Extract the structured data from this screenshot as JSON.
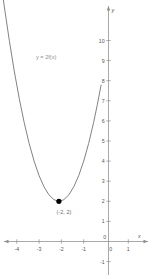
{
  "chart_data": {
    "type": "line",
    "title": "",
    "subtitle": "",
    "xlabel": "x",
    "ylabel": "y",
    "xlim": [
      -4.6,
      1.45
    ],
    "ylim": [
      -1.35,
      10.6
    ],
    "grid": false,
    "legend_position": "none",
    "curve_label": "y = 2f(x)",
    "equation": "y = 2(x + 2)^2 + 2",
    "x_ticks": [
      -4,
      -3,
      -2,
      -1,
      0,
      1
    ],
    "x_tick_labels": [
      "-4",
      "-3",
      "-2",
      "-1",
      "0",
      "1"
    ],
    "y_ticks": [
      -1,
      1,
      2,
      3,
      4,
      5,
      6,
      7,
      8,
      9,
      10
    ],
    "y_tick_labels": [
      "-1",
      "1",
      "2",
      "3",
      "4",
      "5",
      "6",
      "7",
      "8",
      "9",
      "10"
    ],
    "origin_label": "0",
    "series": [
      {
        "name": "y = 2f(x)",
        "x": [
          -4.35,
          -4.2,
          -4.0,
          -3.8,
          -3.6,
          -3.4,
          -3.2,
          -3.0,
          -2.8,
          -2.6,
          -2.4,
          -2.2,
          -2.0,
          -1.8,
          -1.6,
          -1.4,
          -1.2,
          -1.0,
          -0.8,
          -0.6,
          -0.45,
          -0.3
        ],
        "y": [
          13.02,
          11.68,
          10.0,
          8.48,
          7.12,
          5.92,
          4.88,
          4.0,
          3.28,
          2.72,
          2.32,
          2.08,
          2.0,
          2.08,
          2.32,
          2.72,
          3.28,
          4.0,
          4.88,
          5.92,
          6.81,
          7.78
        ]
      }
    ],
    "points": [
      {
        "name": "vertex",
        "x": -2,
        "y": 2,
        "label": "(-2, 2)",
        "marker": "filled-circle"
      }
    ],
    "colors": {
      "curve": "#6b6b6b",
      "axis": "#8c8c8c",
      "tick_text": "#555555",
      "point": "#000000",
      "curve_label": "#8d8d8d",
      "background": "#ffffff"
    }
  }
}
